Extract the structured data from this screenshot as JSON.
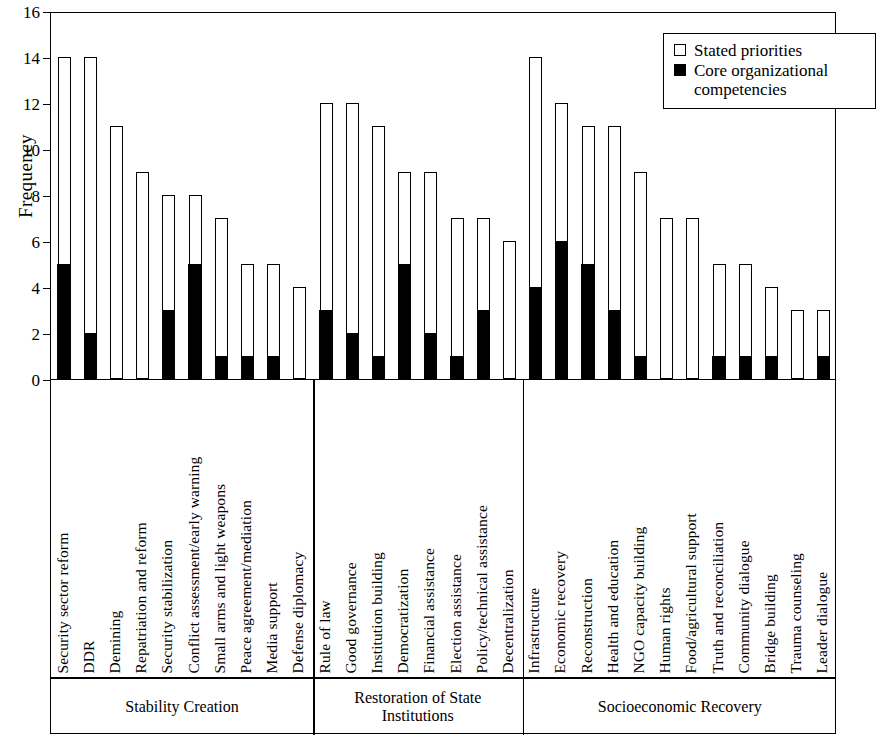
{
  "chart_data": {
    "type": "bar",
    "title": "",
    "subtitle": "",
    "xlabel": "",
    "ylabel": "Frequency",
    "ylim": [
      0,
      16
    ],
    "yticks": [
      0,
      2,
      4,
      6,
      8,
      10,
      12,
      14,
      16
    ],
    "grid": false,
    "stacked": true,
    "legend_position": "top-right",
    "legend": [
      "Stated priorities",
      "Core organizational\ncompetencies"
    ],
    "series": [
      {
        "name": "Stated priorities",
        "color": "#ffffff",
        "values": [
          14,
          14,
          11,
          9,
          8,
          8,
          7,
          5,
          5,
          4,
          12,
          12,
          11,
          9,
          9,
          7,
          7,
          6,
          14,
          12,
          11,
          11,
          9,
          7,
          7,
          5,
          5,
          4,
          3,
          3
        ]
      },
      {
        "name": "Core organizational competencies",
        "color": "#000000",
        "values": [
          5,
          2,
          0,
          0,
          3,
          5,
          1,
          1,
          1,
          0,
          3,
          2,
          1,
          5,
          2,
          1,
          3,
          0,
          4,
          6,
          5,
          3,
          1,
          0,
          0,
          1,
          1,
          1,
          0,
          1
        ]
      }
    ],
    "categories": [
      "Security sector reform",
      "DDR",
      "Demining",
      "Repatriation and reform",
      "Security stabilization",
      "Conflict assessment/early warning",
      "Small arms and light weapons",
      "Peace agreement/mediation",
      "Media support",
      "Defense diplomacy",
      "Rule of law",
      "Good governance",
      "Institution building",
      "Democratization",
      "Financial assistance",
      "Election assistance",
      "Policy/technical assistance",
      "Decentralization",
      "Infrastructure",
      "Economic recovery",
      "Reconstruction",
      "Health and education",
      "NGO capacity building",
      "Human rights",
      "Food/agricultural support",
      "Truth and reconciliation",
      "Community dialogue",
      "Bridge building",
      "Trauma counseling",
      "Leader dialogue"
    ],
    "groups": [
      {
        "name": "Stability Creation",
        "categories": [
          {
            "label": "Security sector reform",
            "total": 14,
            "core": 5
          },
          {
            "label": "DDR",
            "total": 14,
            "core": 2
          },
          {
            "label": "Demining",
            "total": 11,
            "core": 0
          },
          {
            "label": "Repatriation and reform",
            "total": 9,
            "core": 0
          },
          {
            "label": "Security stabilization",
            "total": 8,
            "core": 3
          },
          {
            "label": "Conflict assessment/early warning",
            "total": 8,
            "core": 5
          },
          {
            "label": "Small arms and light weapons",
            "total": 7,
            "core": 1
          },
          {
            "label": "Peace agreement/mediation",
            "total": 5,
            "core": 1
          },
          {
            "label": "Media support",
            "total": 5,
            "core": 1
          },
          {
            "label": "Defense diplomacy",
            "total": 4,
            "core": 0
          }
        ]
      },
      {
        "name": "Restoration of State\nInstitutions",
        "categories": [
          {
            "label": "Rule of law",
            "total": 12,
            "core": 3
          },
          {
            "label": "Good governance",
            "total": 12,
            "core": 2
          },
          {
            "label": "Institution building",
            "total": 11,
            "core": 1
          },
          {
            "label": "Democratization",
            "total": 9,
            "core": 5
          },
          {
            "label": "Financial assistance",
            "total": 9,
            "core": 2
          },
          {
            "label": "Election assistance",
            "total": 7,
            "core": 1
          },
          {
            "label": "Policy/technical assistance",
            "total": 7,
            "core": 3
          },
          {
            "label": "Decentralization",
            "total": 6,
            "core": 0
          }
        ]
      },
      {
        "name": "Socioeconomic Recovery",
        "categories": [
          {
            "label": "Infrastructure",
            "total": 14,
            "core": 4
          },
          {
            "label": "Economic recovery",
            "total": 12,
            "core": 6
          },
          {
            "label": "Reconstruction",
            "total": 11,
            "core": 5
          },
          {
            "label": "Health and education",
            "total": 11,
            "core": 3
          },
          {
            "label": "NGO capacity building",
            "total": 9,
            "core": 1
          },
          {
            "label": "Human rights",
            "total": 7,
            "core": 0
          },
          {
            "label": "Food/agricultural support",
            "total": 7,
            "core": 0
          },
          {
            "label": "Truth and reconciliation",
            "total": 5,
            "core": 1
          },
          {
            "label": "Community dialogue",
            "total": 5,
            "core": 1
          },
          {
            "label": "Bridge building",
            "total": 4,
            "core": 1
          },
          {
            "label": "Trauma counseling",
            "total": 3,
            "core": 0
          },
          {
            "label": "Leader dialogue",
            "total": 3,
            "core": 1
          }
        ]
      }
    ]
  },
  "legend": {
    "stated_label": "Stated priorities",
    "core_label": "Core organizational\ncompetencies"
  },
  "axis": {
    "y_title": "Frequency"
  }
}
